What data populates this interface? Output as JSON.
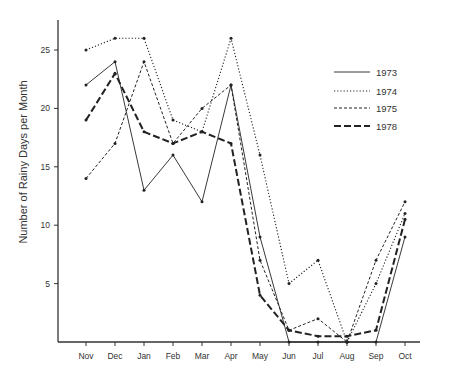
{
  "chart_data": {
    "type": "line",
    "title": "",
    "xlabel": "",
    "ylabel": "Number of Rainy Days per Month",
    "categories": [
      "Nov",
      "Dec",
      "Jan",
      "Feb",
      "Mar",
      "Apr",
      "May",
      "Jun",
      "Jul",
      "Aug",
      "Sep",
      "Oct"
    ],
    "yticks": [
      5,
      10,
      15,
      20,
      25
    ],
    "ylim": [
      0,
      27
    ],
    "grid": false,
    "legend_position": "upper right",
    "series": [
      {
        "name": "1973",
        "style": "solid",
        "values": [
          22,
          24,
          13,
          16,
          12,
          22,
          9,
          0,
          0,
          0,
          0,
          9
        ]
      },
      {
        "name": "1974",
        "style": "dotted",
        "values": [
          25,
          26,
          26,
          19,
          18,
          26,
          16,
          5,
          7,
          0,
          5,
          11
        ]
      },
      {
        "name": "1975",
        "style": "dashed",
        "values": [
          14,
          17,
          24,
          17,
          20,
          22,
          7,
          1,
          2,
          0,
          7,
          12
        ]
      },
      {
        "name": "1978",
        "style": "long-dashed-bold",
        "values": [
          19,
          23,
          18,
          17,
          18,
          17,
          4,
          1,
          0.5,
          0.5,
          1,
          10.5
        ]
      }
    ]
  },
  "legend": {
    "items": [
      "1973",
      "1974",
      "1975",
      "1978"
    ]
  },
  "colors": {
    "line": "#222222",
    "axis": "#333333",
    "background": "#ffffff"
  }
}
